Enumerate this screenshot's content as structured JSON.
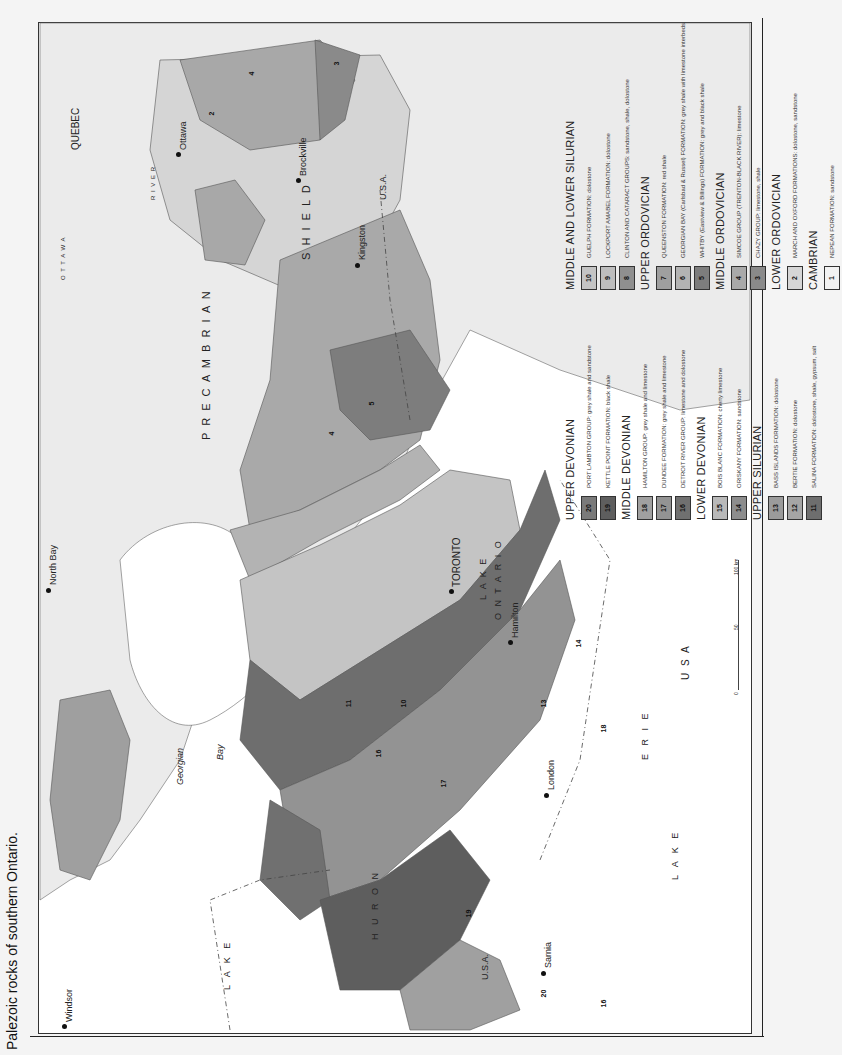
{
  "caption": "Palezoic rocks of southern Ontario.",
  "map": {
    "regions": {
      "precambrian": "P R E C A M B R I A N",
      "shield": "S H I E L D",
      "quebec": "QUEBEC",
      "usa_east": "U.S.A.",
      "usa_south": "U S A",
      "usa_west": "U.S.A.",
      "ottawa_river": "O T T A W A",
      "river": "R I V E R",
      "georgian": "Georgian",
      "bay": "Bay",
      "lake_huron_1": "L A K E",
      "lake_huron_2": "H U R O N",
      "lake_erie_1": "L A K E",
      "lake_erie_2": "E R I E",
      "lake_ontario_1": "L A K E",
      "lake_ontario_2": "O N T A R I O"
    },
    "cities": [
      {
        "name": "North Bay"
      },
      {
        "name": "Ottawa"
      },
      {
        "name": "Brockville"
      },
      {
        "name": "Kingston"
      },
      {
        "name": "TORONTO"
      },
      {
        "name": "Hamilton"
      },
      {
        "name": "London"
      },
      {
        "name": "Sarnia"
      },
      {
        "name": "Windsor"
      }
    ],
    "scale": {
      "zero": "0",
      "mid": "50",
      "end": "100 km"
    },
    "unit_numbers": [
      "1",
      "2",
      "3",
      "4",
      "5",
      "6",
      "7",
      "8",
      "9",
      "10",
      "11",
      "12",
      "13",
      "14",
      "15",
      "16",
      "17",
      "18",
      "19",
      "20"
    ]
  },
  "colors": {
    "lake": "#ffffff",
    "precambrian": "#e9e9e9",
    "u1": "#f2f2f2",
    "u2": "#d6d6d6",
    "u3": "#8a8a8a",
    "u4": "#a9a9a9",
    "u5": "#7d7d7d",
    "u6": "#b3b3b3",
    "u7": "#9f9f9f",
    "u8": "#8f8f8f",
    "u9": "#bdbdbd",
    "u10": "#c4c4c4",
    "u11": "#6e6e6e",
    "u12": "#a5a5a5",
    "u13": "#9b9b9b",
    "u14": "#8d8d8d",
    "u15": "#b9b9b9",
    "u16": "#707070",
    "u17": "#939393",
    "u18": "#a0a0a0",
    "u19": "#5e5e5e",
    "u20": "#7a7a7a"
  },
  "legend": {
    "left_column": [
      {
        "heading": "UPPER DEVONIAN",
        "items": [
          {
            "n": "20",
            "text": "PORT LAMBTON GROUP: grey shale and sandstone"
          },
          {
            "n": "19",
            "text": "KETTLE POINT FORMATION: black shale"
          }
        ]
      },
      {
        "heading": "MIDDLE DEVONIAN",
        "items": [
          {
            "n": "18",
            "text": "HAMILTON GROUP: grey shale and limestone"
          },
          {
            "n": "17",
            "text": "DUNDEE FORMATION: grey shale and limestone"
          },
          {
            "n": "16",
            "text": "DETROIT RIVER GROUP: limestone and dolostone"
          }
        ]
      },
      {
        "heading": "LOWER DEVONIAN",
        "items": [
          {
            "n": "15",
            "text": "BOIS BLANC FORMATION: cherty limestone"
          },
          {
            "n": "14",
            "text": "ORISKANY FORMATION: sandstone"
          }
        ]
      },
      {
        "heading": "UPPER SILURIAN",
        "items": [
          {
            "n": "13",
            "text": "BASS ISLANDS FORMATION: dolostone"
          },
          {
            "n": "12",
            "text": "BERTIE FORMATION: dolostone"
          },
          {
            "n": "11",
            "text": "SALINA FORMATION: dolostone, shale, gypsum, salt"
          }
        ]
      }
    ],
    "right_column": [
      {
        "heading": "MIDDLE AND LOWER SILURIAN",
        "items": [
          {
            "n": "10",
            "text": "GUELPH FORMATION: dolostone"
          },
          {
            "n": "9",
            "text": "LOCKPORT AMABEL FORMATION: dolostone"
          },
          {
            "n": "8",
            "text": "CLINTON AND CATARACT GROUPS: sandstone, shale, dolostone"
          }
        ]
      },
      {
        "heading": "UPPER ORDOVICIAN",
        "items": [
          {
            "n": "7",
            "text": "QUEENSTON FORMATION: red shale"
          },
          {
            "n": "6",
            "text": "GEORGIAN BAY (Carlsbad & Russel) FORMATION: grey shale with limestone interbeds"
          },
          {
            "n": "5",
            "text": "WHITBY (Eastview & Billings) FORMATION: grey and black shale"
          }
        ]
      },
      {
        "heading": "MIDDLE ORDOVICIAN",
        "items": [
          {
            "n": "4",
            "text": "SIMCOE GROUP (TRENTON-BLACK RIVER): limestone"
          },
          {
            "n": "3",
            "text": "CHAZY GROUP: limestone, shale"
          }
        ]
      },
      {
        "heading": "LOWER ORDOVICIAN",
        "items": [
          {
            "n": "2",
            "text": "MARCH AND OXFORD FORMATIONS: dolostone, sandstone"
          }
        ]
      },
      {
        "heading": "CAMBRIAN",
        "items": [
          {
            "n": "1",
            "text": "NEPEAN FORMATION: sandstone"
          }
        ]
      }
    ]
  }
}
